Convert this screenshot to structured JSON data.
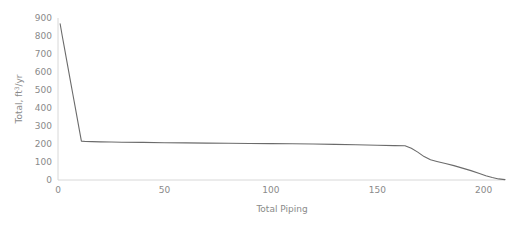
{
  "chart_data": {
    "type": "line",
    "title": "",
    "xlabel": "Total Piping",
    "ylabel_main": "Total, ft",
    "ylabel_sup": "3",
    "ylabel_tail": "/yr",
    "ylabel": "Total, ft3/yr",
    "xlim": [
      0,
      210
    ],
    "ylim": [
      0,
      900
    ],
    "xticks": [
      0,
      50,
      100,
      150,
      200
    ],
    "yticks": [
      0,
      100,
      200,
      300,
      400,
      500,
      600,
      700,
      800,
      900
    ],
    "xtick_labels": [
      "0",
      "50",
      "100",
      "150",
      "200"
    ],
    "ytick_labels": [
      "0",
      "100",
      "200",
      "300",
      "400",
      "500",
      "600",
      "700",
      "800",
      "900"
    ],
    "grid": false,
    "legend": false,
    "line_color": "#6b6b6b",
    "axis_color": "#d8d8d8",
    "tick_label_color": "#8a8a8a",
    "background_color": "#ffffff",
    "series": [
      {
        "name": "Total piping volume",
        "x": [
          1,
          2,
          3,
          4,
          5,
          6,
          7,
          8,
          9,
          10,
          11,
          13,
          16,
          20,
          25,
          30,
          40,
          50,
          60,
          70,
          80,
          90,
          100,
          110,
          120,
          130,
          140,
          150,
          158,
          163,
          166,
          169,
          172,
          175,
          178,
          182,
          186,
          190,
          194,
          198,
          201,
          204,
          207,
          210
        ],
        "y": [
          868,
          800,
          735,
          670,
          605,
          540,
          475,
          410,
          345,
          280,
          216,
          214,
          213,
          212,
          211,
          210,
          209,
          207,
          206,
          205,
          204,
          203,
          202,
          201,
          200,
          198,
          196,
          193,
          191,
          190,
          176,
          155,
          130,
          112,
          103,
          92,
          80,
          66,
          52,
          36,
          24,
          14,
          6,
          2
        ]
      }
    ]
  }
}
